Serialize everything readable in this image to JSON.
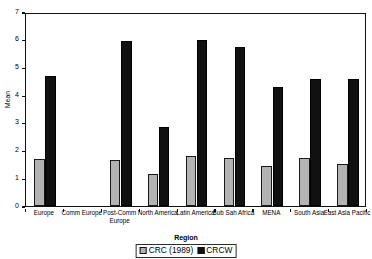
{
  "chart_data": {
    "type": "bar",
    "title": "",
    "xlabel": "Region",
    "ylabel": "Mean",
    "ylim": [
      0,
      7
    ],
    "yticks": [
      0,
      1,
      2,
      3,
      4,
      5,
      6,
      7
    ],
    "grid": false,
    "legend_position": "bottom-center",
    "categories": [
      "Europe",
      "Comm Europe",
      "Post-Comm Europe",
      "North America",
      "Latin America",
      "Sub Sah Africa",
      "MENA",
      "South Asia",
      "East Asia Pacific"
    ],
    "series": [
      {
        "name": "CRC (1989)",
        "color": "#b3b3b3",
        "values": [
          1.7,
          0,
          1.65,
          1.15,
          1.8,
          1.75,
          1.45,
          1.75,
          1.5
        ]
      },
      {
        "name": "CRCW",
        "color": "#111111",
        "values": [
          4.7,
          0,
          5.95,
          2.85,
          6.0,
          5.75,
          4.3,
          4.6,
          4.6
        ]
      }
    ]
  },
  "axes": {
    "y_title": "Mean",
    "x_title": "Region",
    "y_tick_labels": [
      "0",
      "1",
      "2",
      "3",
      "4",
      "5",
      "6",
      "7"
    ]
  },
  "legend": {
    "entries": [
      {
        "label": "CRC (1989)",
        "swatch": "gray-square-swatch"
      },
      {
        "label": "CRCW",
        "swatch": "black-square-swatch"
      }
    ]
  }
}
